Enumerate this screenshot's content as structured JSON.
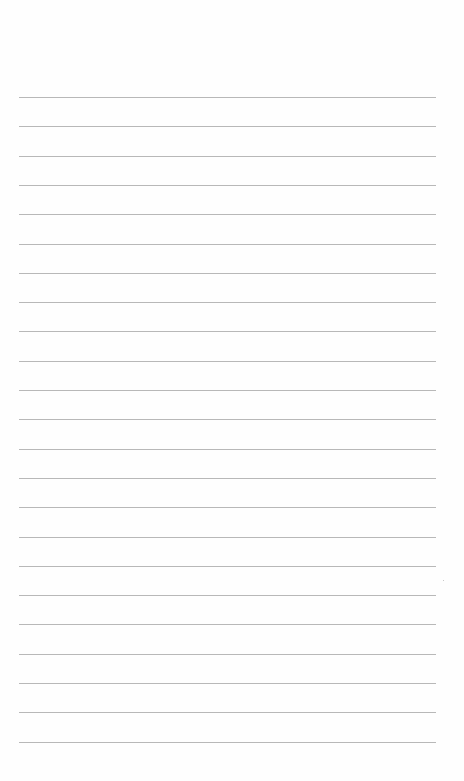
{
  "document": {
    "type": "lined-paper",
    "line_count": 23,
    "first_line_y": 97,
    "line_spacing": 29.3,
    "line_left": 19,
    "line_width": 417,
    "line_color": "#b8b8b8",
    "background": "#fefefe"
  }
}
